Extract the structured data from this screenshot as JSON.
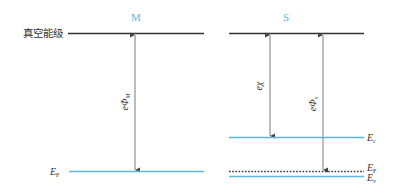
{
  "colors": {
    "vacuum_line": "#333333",
    "band_line": "#5bb8e0",
    "arrow": "#444444",
    "title": "#5bb8e0"
  },
  "diagram": {
    "metal": {
      "title": "M",
      "fermi_label": "E",
      "fermi_sub": "F",
      "work_function_label": "eΦ",
      "work_function_sub": "M"
    },
    "semiconductor": {
      "title": "S",
      "conduction_label": "E",
      "conduction_sub": "c",
      "fermi_label": "E",
      "fermi_sub": "F",
      "valence_label": "E",
      "valence_sub": "v",
      "affinity_label": "eχ",
      "work_function_label": "eΦ",
      "work_function_sub": "s"
    },
    "vacuum_level_label": "真空能级"
  }
}
